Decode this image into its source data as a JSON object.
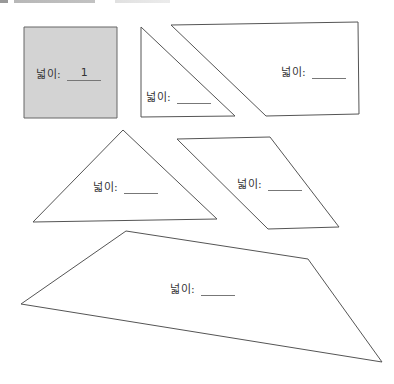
{
  "header": {
    "cutoff_text": ""
  },
  "colors": {
    "stroke": "#555555",
    "shaded_fill": "#d3d3d3",
    "fill": "#ffffff"
  },
  "shapes": [
    {
      "id": "square",
      "type": "square",
      "points": "24,27 117,27 117,118 24,118",
      "shaded": true,
      "label": "넓이:",
      "answer": "1",
      "label_pos": {
        "x": 36,
        "y": 65
      }
    },
    {
      "id": "right-triangle",
      "type": "triangle",
      "points": "141,27 141,117 235,116",
      "shaded": false,
      "label": "넓이:",
      "answer": "",
      "label_pos": {
        "x": 146,
        "y": 88
      }
    },
    {
      "id": "right-trapezoid",
      "type": "trapezoid",
      "points": "171,25 358,22 359,114 266,116",
      "shaded": false,
      "label": "넓이:",
      "answer": "",
      "label_pos": {
        "x": 281,
        "y": 63
      }
    },
    {
      "id": "triangle",
      "type": "triangle",
      "points": "123,130 33,222 217,219",
      "shaded": false,
      "label": "넓이:",
      "answer": "",
      "label_pos": {
        "x": 93,
        "y": 178
      }
    },
    {
      "id": "parallelogram",
      "type": "parallelogram",
      "points": "177,139 270,137 339,227 268,229",
      "shaded": false,
      "label": "넓이:",
      "answer": "",
      "label_pos": {
        "x": 237,
        "y": 175
      }
    },
    {
      "id": "quadrilateral",
      "type": "quadrilateral",
      "points": "126,231 308,259 382,362 21,304",
      "shaded": false,
      "label": "넓이:",
      "answer": "",
      "label_pos": {
        "x": 170,
        "y": 280
      }
    }
  ]
}
